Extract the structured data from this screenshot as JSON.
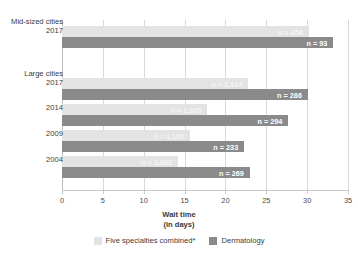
{
  "chart_data": {
    "type": "bar",
    "orientation": "horizontal",
    "title": "",
    "xlabel": "Wait time",
    "xlabel_line2": "(in days)",
    "ylabel": "",
    "xlim": [
      0,
      35
    ],
    "xticks": [
      0,
      5,
      10,
      15,
      20,
      25,
      30,
      35
    ],
    "xtick_labels": [
      "0",
      "5",
      "10",
      "15",
      "20",
      "25",
      "30",
      "35"
    ],
    "grid": true,
    "legend_position": "bottom",
    "series": [
      {
        "name": "Five specialties combined*",
        "color": "#e3e3e3",
        "values": [
          30.2,
          22.8,
          17.8,
          15.7,
          14.2
        ],
        "point_labels": [
          "n = 454",
          "n = 1,414",
          "n = 1,305",
          "n = 1,162",
          "n = 1,062"
        ]
      },
      {
        "name": "Dermatology",
        "color": "#8a8a8a",
        "values": [
          33.2,
          30.1,
          27.7,
          22.3,
          23.0
        ],
        "point_labels": [
          "n = 93",
          "n = 286",
          "n = 294",
          "n = 233",
          "n = 269"
        ]
      }
    ],
    "groups": [
      {
        "group": "Mid-sized cities",
        "year": "2017"
      },
      {
        "group": "Large cities",
        "year": "2017"
      },
      {
        "group": "",
        "year": "2014"
      },
      {
        "group": "",
        "year": "2009"
      },
      {
        "group": "",
        "year": "2004"
      }
    ]
  },
  "legend": {
    "items": [
      {
        "label": "Five specialties combined*",
        "swatch": "light"
      },
      {
        "label": "Dermatology",
        "swatch": "dark"
      }
    ]
  }
}
